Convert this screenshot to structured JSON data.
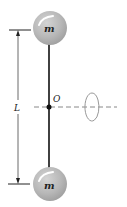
{
  "diagram": {
    "masses": [
      {
        "label": "m",
        "position": "top"
      },
      {
        "label": "m",
        "position": "bottom"
      }
    ],
    "length_label": "L",
    "pivot_label": "O",
    "rotation_axis": "dashed horizontal axis through O with rotation indicator",
    "colors": {
      "mass_fill": "#b8b8b8",
      "mass_highlight": "#ffffff",
      "rod": "#111111",
      "axis": "#888888",
      "dimension_line": "#222222"
    }
  }
}
